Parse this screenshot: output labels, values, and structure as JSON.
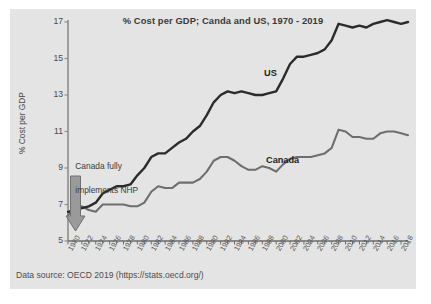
{
  "figure": {
    "background_color": "#ffffff",
    "panel_color": "#e4e4e4"
  },
  "source_note": "Data source: OECD 2019 (https://stats.oecd.org/)",
  "annotation": {
    "line1": "Canada fully",
    "line2": "implements NHP",
    "arrow_year": 1972
  },
  "series_labels": {
    "us": "US",
    "canada": "Canada"
  },
  "chart_data": {
    "type": "line",
    "title": "% Cost per GDP; Canda and US, 1970 - 2019",
    "xlabel": "",
    "ylabel": "% Cost per GDP",
    "xlim": [
      1970,
      2019
    ],
    "ylim": [
      5,
      17
    ],
    "yticks": [
      5,
      7,
      9,
      11,
      13,
      15,
      17
    ],
    "xticks": [
      1970,
      1972,
      1974,
      1976,
      1978,
      1980,
      1982,
      1984,
      1986,
      1988,
      1990,
      1992,
      1994,
      1996,
      1998,
      2000,
      2002,
      2004,
      2006,
      2008,
      2010,
      2012,
      2014,
      2016,
      2018
    ],
    "xtick_minor_step": 1,
    "grid": false,
    "legend": "inline-annotations",
    "x": [
      1970,
      1971,
      1972,
      1973,
      1974,
      1975,
      1976,
      1977,
      1978,
      1979,
      1980,
      1981,
      1982,
      1983,
      1984,
      1985,
      1986,
      1987,
      1988,
      1989,
      1990,
      1991,
      1992,
      1993,
      1994,
      1995,
      1996,
      1997,
      1998,
      1999,
      2000,
      2001,
      2002,
      2003,
      2004,
      2005,
      2006,
      2007,
      2008,
      2009,
      2010,
      2011,
      2012,
      2013,
      2014,
      2015,
      2016,
      2017,
      2018,
      2019
    ],
    "series": [
      {
        "name": "US",
        "color": "#2b2b2b",
        "values": [
          6.6,
          6.7,
          6.8,
          6.9,
          7.1,
          7.6,
          7.8,
          8.0,
          8.0,
          8.1,
          8.6,
          9.0,
          9.6,
          9.8,
          9.8,
          10.1,
          10.4,
          10.6,
          11.0,
          11.3,
          11.9,
          12.6,
          13.0,
          13.2,
          13.1,
          13.2,
          13.1,
          13.0,
          13.0,
          13.1,
          13.2,
          13.9,
          14.7,
          15.1,
          15.1,
          15.2,
          15.3,
          15.5,
          16.0,
          16.9,
          16.8,
          16.7,
          16.8,
          16.7,
          16.9,
          17.0,
          17.1,
          17.0,
          16.9,
          17.0
        ]
      },
      {
        "name": "Canada",
        "color": "#6e6e6e",
        "values": [
          6.4,
          6.9,
          6.9,
          6.7,
          6.6,
          7.0,
          7.0,
          7.0,
          7.0,
          6.9,
          6.9,
          7.1,
          7.7,
          8.0,
          7.9,
          7.9,
          8.2,
          8.2,
          8.2,
          8.4,
          8.8,
          9.4,
          9.6,
          9.6,
          9.4,
          9.1,
          8.9,
          8.9,
          9.1,
          9.0,
          8.8,
          9.2,
          9.5,
          9.6,
          9.6,
          9.6,
          9.7,
          9.8,
          10.1,
          11.1,
          11.0,
          10.7,
          10.7,
          10.6,
          10.6,
          10.9,
          11.0,
          11.0,
          10.9,
          10.8
        ]
      }
    ]
  }
}
